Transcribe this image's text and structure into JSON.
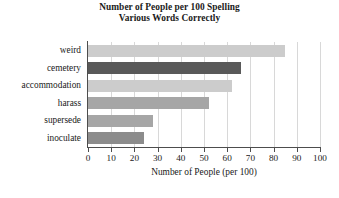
{
  "chart_data": {
    "type": "bar",
    "orientation": "horizontal",
    "title": "Number of People per 100 Spelling Various Words Correctly",
    "title_lines": [
      "Number of People per 100 Spelling",
      "Various Words Correctly"
    ],
    "categories": [
      "weird",
      "cemetery",
      "accommodation",
      "harass",
      "supersede",
      "inoculate"
    ],
    "values": [
      85,
      66,
      62,
      52,
      28,
      24
    ],
    "bar_colors": [
      "#cccccc",
      "#595959",
      "#cccccc",
      "#a6a6a6",
      "#a6a6a6",
      "#8c8c8c"
    ],
    "xlabel": "Number of People (per 100)",
    "ylabel": "",
    "xlim": [
      0,
      100
    ],
    "xticks": [
      0,
      10,
      20,
      30,
      40,
      50,
      60,
      70,
      80,
      90,
      100
    ],
    "xticklabels": [
      "0",
      "10",
      "20",
      "30",
      "40",
      "50",
      "60",
      "70",
      "80",
      "90",
      "100"
    ],
    "grid": "vertical",
    "legend": "none",
    "annotations": []
  },
  "figure": {
    "background_color": "#ffffff",
    "axis_color": "#4d4d4d",
    "grid_color": "#d8d8d8",
    "footer_artifact": "scanned page text remnant"
  }
}
